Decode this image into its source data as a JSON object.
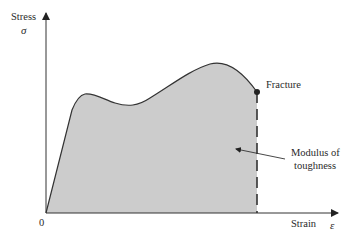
{
  "diagram": {
    "y_axis": {
      "label": "Stress",
      "symbol": "σ"
    },
    "x_axis": {
      "label": "Strain",
      "symbol": "ε"
    },
    "origin_label": "0",
    "fracture_label": "Fracture",
    "area_label_line1": "Modulus of",
    "area_label_line2": "toughness",
    "colors": {
      "fill": "#cccccc",
      "stroke": "#333333",
      "background": "#ffffff"
    }
  }
}
